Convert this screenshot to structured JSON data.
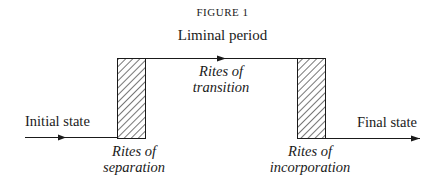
{
  "figure": {
    "title": "FIGURE 1",
    "top_label": "Liminal period",
    "left_label": "Initial state",
    "right_label": "Final state",
    "middle_label": {
      "line1": "Rites of",
      "line2": "transition"
    },
    "separation_label": {
      "line1": "Rites of",
      "line2": "separation"
    },
    "incorporation_label": {
      "line1": "Rites of",
      "line2": "incorporation"
    }
  },
  "diagram": {
    "stroke_color": "#1a1a1a",
    "hatch_color": "#1a1a1a",
    "boxes": [
      {
        "name": "separation-box",
        "x": 117,
        "y": 58,
        "width": 28,
        "height": 80
      },
      {
        "name": "incorporation-box",
        "x": 297,
        "y": 58,
        "width": 28,
        "height": 80
      }
    ]
  }
}
